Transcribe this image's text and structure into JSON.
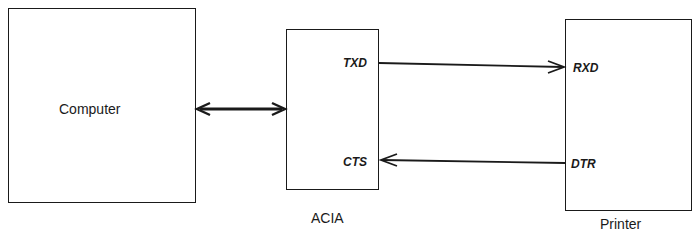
{
  "diagram": {
    "type": "block-diagram",
    "blocks": [
      {
        "id": "computer",
        "label": "Computer"
      },
      {
        "id": "acia",
        "label": "ACIA",
        "pins": {
          "txd": "TXD",
          "cts": "CTS"
        }
      },
      {
        "id": "printer",
        "label": "Printer",
        "pins": {
          "rxd": "RXD",
          "dtr": "DTR"
        }
      }
    ],
    "connections": [
      {
        "from": "Computer",
        "to": "ACIA",
        "direction": "bidirectional"
      },
      {
        "from": "TXD",
        "to": "RXD",
        "direction": "ACIA → Printer"
      },
      {
        "from": "DTR",
        "to": "CTS",
        "direction": "Printer → ACIA"
      }
    ]
  },
  "computer": {
    "label": "Computer"
  },
  "acia": {
    "label": "ACIA",
    "txd": "TXD",
    "cts": "CTS"
  },
  "printer": {
    "label": "Printer",
    "rxd": "RXD",
    "dtr": "DTR"
  },
  "colors": {
    "line": "#1a1a1a",
    "background": "#ffffff"
  }
}
